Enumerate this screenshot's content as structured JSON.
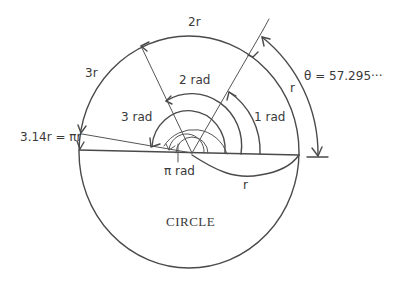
{
  "diagram": {
    "title": "CIRCLE",
    "colors": {
      "line": "#4a4a4a",
      "text": "#3a3a3a",
      "background": "#ffffff"
    },
    "arc_labels": {
      "two_r": "2r",
      "three_r": "3r",
      "pi_r": "3.14r = πr",
      "r_outer": "r",
      "r_lower": "r"
    },
    "angle_labels": {
      "one_rad": "1 rad",
      "two_rad": "2 rad",
      "three_rad": "3 rad",
      "pi_rad": "π rad"
    },
    "theta_label": "θ = 57.295···"
  }
}
